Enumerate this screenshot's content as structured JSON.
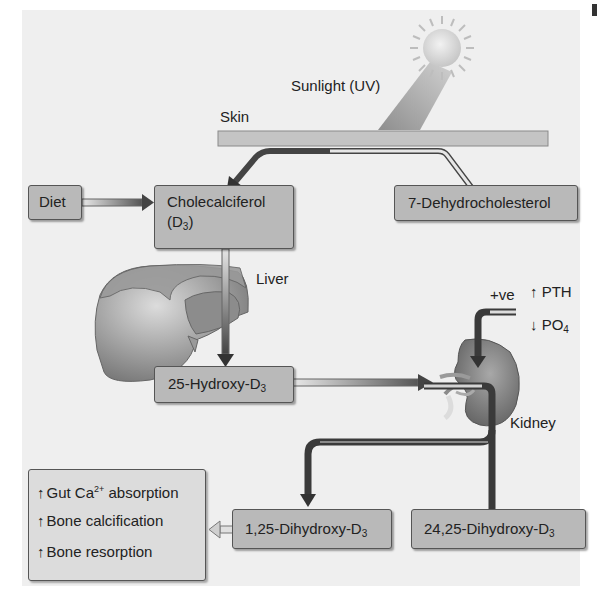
{
  "labels": {
    "sunlight": "Sunlight (UV)",
    "skin": "Skin",
    "liver": "Liver",
    "kidney": "Kidney",
    "positive": "+ve",
    "pth_arrow": "↑",
    "pth": "PTH",
    "po4_arrow": "↓",
    "po4": "PO",
    "po4_sub": "4"
  },
  "boxes": {
    "diet": "Diet",
    "cholecalciferol": "Cholecalciferol",
    "cholecalciferol_paren_open": "(D",
    "cholecalciferol_sub": "3",
    "cholecalciferol_paren_close": ")",
    "dehydrocholesterol": "7-Dehydrocholesterol",
    "hydroxy25": "25-Hydroxy-D",
    "hydroxy25_sub": "3",
    "dihydroxy125": "1,25-Dihydroxy-D",
    "dihydroxy125_sub": "3",
    "dihydroxy2425": "24,25-Dihydroxy-D",
    "dihydroxy2425_sub": "3"
  },
  "effects": [
    {
      "arrow": "↑",
      "text_pre": "Gut Ca",
      "sup": "2+",
      "text_post": " absorption"
    },
    {
      "arrow": "↑",
      "text_pre": "Bone calcification",
      "sup": "",
      "text_post": ""
    },
    {
      "arrow": "↑",
      "text_pre": "Bone resorption",
      "sup": "",
      "text_post": ""
    }
  ],
  "colors": {
    "panel": "#efefef",
    "box_fill": "#b9b9b9",
    "box_border": "#555555",
    "effects_fill": "#dcdcdc",
    "arrow_dark": "#3a3a3a",
    "skin_band": "#c4c4c4",
    "sun": "#d8d8d8"
  }
}
